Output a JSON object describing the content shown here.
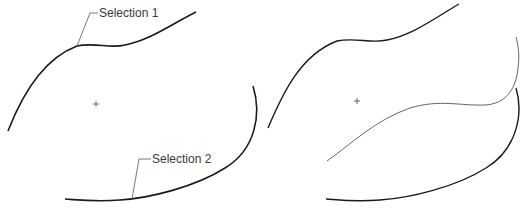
{
  "panels": [
    {
      "name": "before",
      "labels": [
        {
          "text": "Selection 1"
        },
        {
          "text": "Selection 2"
        }
      ]
    },
    {
      "name": "after",
      "labels": []
    }
  ],
  "colors": {
    "curve": "#1a1a1a",
    "blend_curve": "#555555",
    "leader": "#555555",
    "text": "#3a3a3a"
  }
}
